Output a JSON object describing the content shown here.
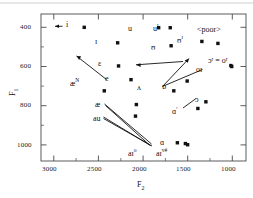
{
  "chart_data": {
    "type": "scatter",
    "title": "",
    "xlabel": "F2",
    "ylabel": "F1",
    "xticks": [
      3000,
      2500,
      2000,
      1500,
      1000
    ],
    "yticks": [
      400,
      600,
      800,
      1000
    ],
    "xlim": [
      3150,
      850
    ],
    "ylim": [
      1080,
      330
    ],
    "x_axis_reversed": true,
    "y_axis_reversed": true,
    "grid": false,
    "legend": null,
    "minor_ticks": true,
    "annotations": [
      "<poor>"
    ],
    "points": [
      {
        "label": "i",
        "sup": "",
        "F2": 2665,
        "F1": 398,
        "lx": 66,
        "ly": 21
      },
      {
        "label": "ɪ",
        "sup": "",
        "F2": 2290,
        "F1": 477,
        "lx": 95,
        "ly": 38
      },
      {
        "label": "ɛ",
        "sup": "",
        "F2": 2280,
        "F1": 595,
        "lx": 98,
        "ly": 60
      },
      {
        "label": "e",
        "sup": "",
        "F2": 2140,
        "F1": 665,
        "lx": 105,
        "ly": 75
      },
      {
        "label": "æ",
        "sup": "N",
        "F2": 2440,
        "F1": 722,
        "lx": 70,
        "ly": 80
      },
      {
        "label": "æ",
        "sup": "",
        "F2": 2080,
        "F1": 792,
        "lx": 95,
        "ly": 101
      },
      {
        "label": "au",
        "sup": "",
        "F2": 2090,
        "F1": 851,
        "lx": 93,
        "ly": 115
      },
      {
        "label": "aɪ",
        "sup": "o",
        "F2": 1620,
        "F1": 987,
        "lx": 128,
        "ly": 150
      },
      {
        "label": "aɪ",
        "sup": "v#",
        "F2": 1530,
        "F1": 991,
        "lx": 156,
        "ly": 150
      },
      {
        "label": "ɑ",
        "sup": "",
        "F2": 1505,
        "F1": 997,
        "lx": 160,
        "ly": 139
      },
      {
        "label": "ʌ",
        "sup": "",
        "F2": 1660,
        "F1": 722,
        "lx": 137,
        "ly": 84
      },
      {
        "label": "ɒ",
        "sup": "",
        "F2": 1510,
        "F1": 672,
        "lx": 162,
        "ly": 83
      },
      {
        "label": "u",
        "sup": "",
        "F2": 1830,
        "F1": 400,
        "lx": 128,
        "ly": 25
      },
      {
        "label": "u",
        "sup": "ɪ",
        "F2": 1700,
        "F1": 400,
        "lx": 153,
        "ly": 25
      },
      {
        "label": "ʊ",
        "sup": "",
        "F2": 1690,
        "F1": 492,
        "lx": 151,
        "ly": 44
      },
      {
        "label": "ʊ",
        "sup": "ɪ",
        "F2": 1345,
        "F1": 470,
        "lx": 177,
        "ly": 37
      },
      {
        "label": "<poor>",
        "sup": "",
        "F2": 1165,
        "F1": 480,
        "lx": 197,
        "ly": 26
      },
      {
        "label": "ɔʳ = oʳ",
        "sup": "",
        "F2": 1020,
        "F1": 593,
        "lx": 208,
        "ly": 57
      },
      {
        "label": "oɪ",
        "sup": "",
        "F2": 1010,
        "F1": 598,
        "lx": 196,
        "ly": 66
      },
      {
        "label": "ɔ",
        "sup": "",
        "F2": 1300,
        "F1": 778,
        "lx": 195,
        "ly": 96
      },
      {
        "label": "ɑ",
        "sup": "ʳ",
        "F2": 1390,
        "F1": 812,
        "lx": 172,
        "ly": 108
      }
    ]
  },
  "axis": {
    "xlabel_text": "F",
    "xlabel_sub": "2",
    "ylabel_text": "F",
    "ylabel_sub": "1",
    "xticks_text": [
      "3000",
      "2500",
      "2000",
      "1500",
      "1000"
    ],
    "yticks_text": [
      "400",
      "600",
      "800",
      "1000"
    ]
  }
}
